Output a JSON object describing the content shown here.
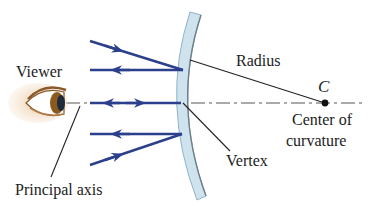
{
  "diagram": {
    "labels": {
      "viewer": "Viewer",
      "radius": "Radius",
      "center_symbol": "C",
      "center_line1": "Center of",
      "center_line2": "curvature",
      "vertex": "Vertex",
      "principal_axis": "Principal axis"
    },
    "colors": {
      "ray": "#2b3f8c",
      "mirror_fill": "#cfe3ef",
      "mirror_edge": "#8fb3c9",
      "mirror_inner_edge": "#6f7f8a",
      "axis": "#555555",
      "leader": "#222222",
      "text": "#222222"
    },
    "elements": [
      {
        "name": "viewer-eye",
        "type": "eye"
      },
      {
        "name": "concave-mirror",
        "type": "mirror"
      },
      {
        "name": "principal-axis",
        "type": "dash-dot-line"
      },
      {
        "name": "center-of-curvature-point",
        "type": "point",
        "label": "C"
      },
      {
        "name": "incident-ray-top",
        "direction": "toward mirror"
      },
      {
        "name": "reflected-ray-top",
        "direction": "toward viewer"
      },
      {
        "name": "axial-ray",
        "direction": "both"
      },
      {
        "name": "reflected-ray-bottom",
        "direction": "toward viewer"
      },
      {
        "name": "incident-ray-bottom",
        "direction": "toward mirror"
      }
    ]
  }
}
